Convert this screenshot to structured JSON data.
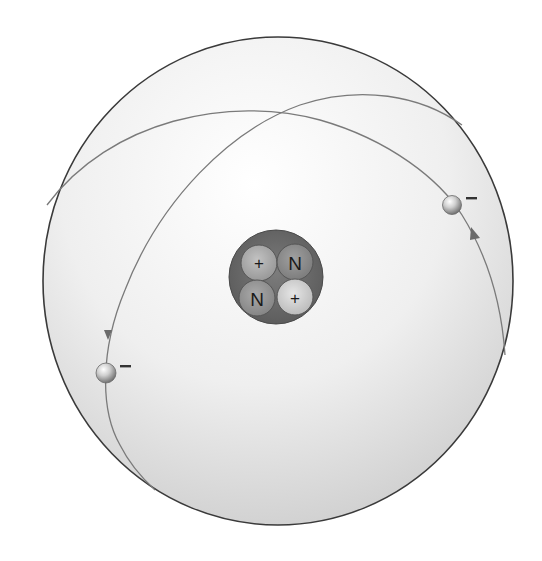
{
  "diagram": {
    "type": "atom-model",
    "element_depicted": "helium",
    "colors": {
      "background": "#ffffff",
      "sphere_outline": "#3a3a3a",
      "sphere_fill_light": "#ffffff",
      "sphere_fill_dark": "#cfcfcf",
      "orbit_line": "#7a7a7a",
      "nucleus_fill": "#6f6f6f",
      "electron_light": "#f4f4f4",
      "electron_dark": "#7d7d7d",
      "minus_sign": "#333333"
    },
    "nucleus": {
      "particles": [
        {
          "id": "proton-1",
          "kind": "proton",
          "label": "+",
          "position": "top-left",
          "fill": "#a9a9a9"
        },
        {
          "id": "neutron-1",
          "kind": "neutron",
          "label": "N",
          "position": "top-right",
          "fill": "#8c8c8c"
        },
        {
          "id": "neutron-2",
          "kind": "neutron",
          "label": "N",
          "position": "bottom-left",
          "fill": "#959595"
        },
        {
          "id": "proton-2",
          "kind": "proton",
          "label": "+",
          "position": "bottom-right",
          "fill": "#cdcdcd"
        }
      ]
    },
    "electrons": [
      {
        "id": "electron-right",
        "charge_label": "−",
        "orbit": "orbit-a"
      },
      {
        "id": "electron-left",
        "charge_label": "−",
        "orbit": "orbit-b"
      }
    ],
    "orbits": [
      {
        "id": "orbit-a",
        "direction_arrow": "clockwise"
      },
      {
        "id": "orbit-b",
        "direction_arrow": "counter-clockwise"
      }
    ]
  }
}
